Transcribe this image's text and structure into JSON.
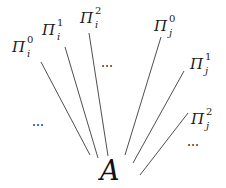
{
  "diagram": {
    "apex": {
      "label": "A",
      "x": 100,
      "y": 157
    },
    "line_color": "#3a3a3a",
    "nodes": [
      {
        "id": "pi_i_0",
        "base": "Π",
        "sup": "0",
        "sub": "i",
        "x": 12,
        "y": 40,
        "line": [
          41,
          62,
          90,
          155
        ]
      },
      {
        "id": "pi_i_1",
        "base": "Π",
        "sup": "1",
        "sub": "i",
        "x": 42,
        "y": 23,
        "line": [
          65,
          47,
          98,
          158
        ]
      },
      {
        "id": "pi_i_2",
        "base": "Π",
        "sup": "2",
        "sub": "i",
        "x": 80,
        "y": 11,
        "line": [
          89,
          33,
          108,
          156
        ]
      },
      {
        "id": "pi_j_0",
        "base": "Π",
        "sup": "0",
        "sub": "j",
        "x": 154,
        "y": 19,
        "line": [
          161,
          37,
          125,
          155
        ]
      },
      {
        "id": "pi_j_1",
        "base": "Π",
        "sup": "1",
        "sub": "j",
        "x": 190,
        "y": 57,
        "line": [
          184,
          71,
          133,
          163
        ]
      },
      {
        "id": "pi_j_2",
        "base": "Π",
        "sup": "2",
        "sub": "j",
        "x": 191,
        "y": 112,
        "line": [
          188,
          113,
          140,
          175
        ]
      }
    ],
    "ellipses": [
      {
        "id": "dots-top",
        "text": "⋯",
        "x": 101,
        "y": 60
      },
      {
        "id": "dots-left",
        "text": "⋯",
        "x": 32,
        "y": 119
      },
      {
        "id": "dots-right",
        "text": "⋯",
        "x": 187,
        "y": 139
      }
    ]
  }
}
